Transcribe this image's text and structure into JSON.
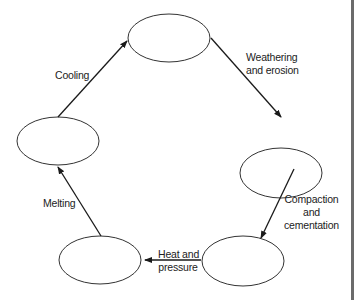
{
  "diagram": {
    "nodes": [
      {
        "id": "top",
        "label": ""
      },
      {
        "id": "right",
        "label": ""
      },
      {
        "id": "bottom-right",
        "label": ""
      },
      {
        "id": "bottom-left",
        "label": ""
      },
      {
        "id": "left",
        "label": ""
      }
    ],
    "edges": [
      {
        "from": "left",
        "to": "top",
        "label": "Cooling"
      },
      {
        "from": "top",
        "to": "right",
        "label_line1": "Weathering",
        "label_line2": "and erosion"
      },
      {
        "from": "right",
        "to": "bottom-right",
        "label_line1": "Compaction",
        "label_line2": "and",
        "label_line3": "cementation"
      },
      {
        "from": "bottom-right",
        "to": "bottom-left",
        "label_line1": "Heat and",
        "label_line2": "pressure"
      },
      {
        "from": "bottom-left",
        "to": "left",
        "label": "Melting"
      }
    ],
    "colors": {
      "stroke": "#1a1a1a",
      "text": "#222222",
      "edge_bar": "#6b6b6b"
    }
  }
}
